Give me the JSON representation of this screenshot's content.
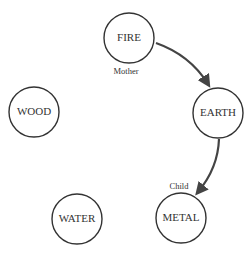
{
  "diagram": {
    "nodes": [
      {
        "id": "fire",
        "label": "FIRE"
      },
      {
        "id": "earth",
        "label": "EARTH"
      },
      {
        "id": "metal",
        "label": "METAL"
      },
      {
        "id": "water",
        "label": "WATER"
      },
      {
        "id": "wood",
        "label": "WOOD"
      }
    ],
    "annotations": {
      "mother": "Mother",
      "child": "Child"
    },
    "edges": [
      {
        "from": "FIRE",
        "to": "EARTH"
      },
      {
        "from": "EARTH",
        "to": "METAL"
      }
    ],
    "colors": {
      "stroke": "#333333",
      "arrow": "#444444",
      "background": "#ffffff"
    }
  }
}
